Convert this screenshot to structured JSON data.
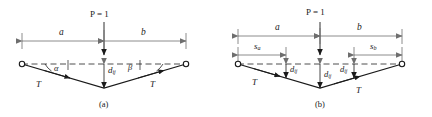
{
  "figure": {
    "caption_a": "(a)",
    "caption_b": "(b)",
    "colors": {
      "ink": "#1a1a1a",
      "dimension": "#6e6e6e",
      "dashed_chord": "#3a3a3a"
    }
  },
  "panel_a": {
    "load_label": "P = 1",
    "dim_left": "a",
    "dim_right": "b",
    "angle_left": "α",
    "angle_right": "β",
    "tension_left": "T",
    "tension_right": "T",
    "sag": {
      "base": "d",
      "sub": "ij"
    }
  },
  "panel_b": {
    "load_label": "P = 1",
    "dim_left": "a",
    "dim_right": "b",
    "station_left": {
      "base": "s",
      "sub": "a"
    },
    "station_right": {
      "base": "s",
      "sub": "b"
    },
    "tension_left": "T",
    "tension_right": "T",
    "sag_left": {
      "base": "d",
      "sub": "ij"
    },
    "sag_mid": {
      "base": "d",
      "sub": "ij"
    },
    "sag_right": {
      "base": "d",
      "sub": "ij"
    }
  }
}
